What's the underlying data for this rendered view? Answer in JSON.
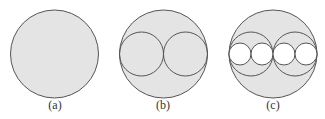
{
  "figure": {
    "panels": [
      {
        "label": "(a)",
        "description": "single large circle",
        "cx": 54.5,
        "cy": 54,
        "r": 44,
        "inner": []
      },
      {
        "label": "(b)",
        "description": "large circle with two tangent inner circles",
        "cx": 163.5,
        "cy": 54,
        "r": 44,
        "inner": [
          {
            "cx": 141.5,
            "cy": 54,
            "r": 22,
            "fill": "none"
          },
          {
            "cx": 185.5,
            "cy": 54,
            "r": 22,
            "fill": "none"
          }
        ]
      },
      {
        "label": "(c)",
        "description": "large circle with two inner circles each containing two smaller white circles",
        "cx": 273,
        "cy": 54,
        "r": 44,
        "inner": [
          {
            "cx": 251,
            "cy": 54,
            "r": 22,
            "fill": "none"
          },
          {
            "cx": 295,
            "cy": 54,
            "r": 22,
            "fill": "none"
          },
          {
            "cx": 240,
            "cy": 54,
            "r": 11,
            "fill": "#ffffff"
          },
          {
            "cx": 262,
            "cy": 54,
            "r": 11,
            "fill": "#ffffff"
          },
          {
            "cx": 284,
            "cy": 54,
            "r": 11,
            "fill": "#ffffff"
          },
          {
            "cx": 306,
            "cy": 54,
            "r": 11,
            "fill": "#ffffff"
          }
        ]
      }
    ],
    "colors": {
      "fill": "#e4e4e4",
      "stroke": "#555555",
      "background": "#ffffff"
    }
  }
}
